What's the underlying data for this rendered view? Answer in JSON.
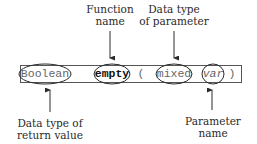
{
  "diagram": {
    "signature": {
      "return_type": "Boolean",
      "function_name": "empty",
      "open_paren": "(",
      "param_type": "mixed",
      "param_name": "var",
      "close_paren": ")"
    },
    "annotations": {
      "function_name": {
        "line1": "Function",
        "line2": "name"
      },
      "param_type": {
        "line1": "Data type",
        "line2": "of parameter"
      },
      "return_type": {
        "line1": "Data type of",
        "line2": "return value"
      },
      "param_name": {
        "line1": "Parameter",
        "line2": "name"
      }
    },
    "colors": {
      "stroke": "#2a2a2a",
      "code_text": "#666666",
      "emphasis_text": "#111111"
    }
  }
}
